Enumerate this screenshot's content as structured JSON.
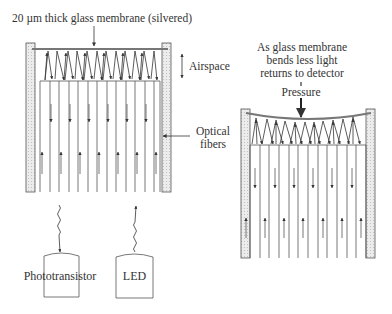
{
  "left_device": {
    "membrane_label": "20 µm thick glass membrane (silvered)",
    "airspace_label": "Airspace",
    "fibers_label_line1": "Optical",
    "fibers_label_line2": "fibers",
    "detector_label": "Phototransistor",
    "source_label": "LED"
  },
  "right_device": {
    "caption_line1": "As glass membrane",
    "caption_line2": "bends less light",
    "caption_line3": "returns to detector",
    "pressure_label": "Pressure"
  },
  "colors": {
    "line": "#333333",
    "wall_fill": "#e6e6e6",
    "membrane": "#888888"
  }
}
